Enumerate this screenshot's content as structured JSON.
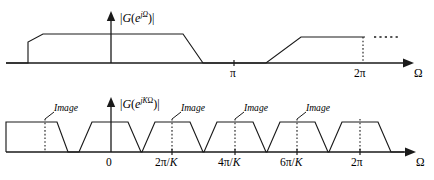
{
  "figure": {
    "title": "",
    "background": "#ffffff",
    "stroke_color": "#1a1a1a"
  },
  "top_plot": {
    "ylabel": {
      "mag_open": "|",
      "g": "G",
      "paren_open": "(",
      "e": "e",
      "exp": "jΩ",
      "paren_close": ")",
      "mag_close": "|"
    },
    "xlabel": "Ω",
    "ticks": [
      {
        "label": "π",
        "x_px": 234
      },
      {
        "label": "2π",
        "x_px": 363
      }
    ],
    "dotted_marker_label": "2π"
  },
  "bottom_plot": {
    "ylabel": {
      "mag_open": "|",
      "g": "G",
      "paren_open": "(",
      "e": "e",
      "exp_j": "j",
      "exp_k": "K",
      "exp_omega": "Ω",
      "paren_close": ")",
      "mag_close": "|"
    },
    "xlabel": "Ω",
    "ticks": [
      {
        "label": "0",
        "x_px": 110
      },
      {
        "label": "2π/K",
        "x_px": 172
      },
      {
        "label": "4π/K",
        "x_px": 235
      },
      {
        "label": "6π/K",
        "x_px": 297
      },
      {
        "label": "2π",
        "x_px": 360
      }
    ],
    "annotations": [
      {
        "label": "Image",
        "x_px": 52,
        "y_px": 108
      },
      {
        "label": "Image",
        "x_px": 190,
        "y_px": 108
      },
      {
        "label": "Image",
        "x_px": 252,
        "y_px": 108
      },
      {
        "label": "Image",
        "x_px": 315,
        "y_px": 108
      }
    ]
  },
  "chart_data": {
    "type": "line",
    "panels": [
      {
        "name": "top",
        "ylabel": "|G(e^{jΩ})|",
        "xlabel": "Ω",
        "xticks": [
          "π",
          "2π"
        ],
        "xtick_values": [
          3.14159,
          6.28319
        ],
        "description": "Lowpass magnitude response: flat passband around Ω=0, transition band down to zero before π, then mirrored rise after π back to flat, continuing periodically past 2π (shown dotted).",
        "series": [
          {
            "name": "|G(e^{jOmega})|",
            "points_px": [
              [
                6,
                63
              ],
              [
                28,
                63
              ],
              [
                28,
                42
              ],
              [
                42,
                34
              ],
              [
                183,
                34
              ],
              [
                203,
                63
              ],
              [
                266,
                63
              ],
              [
                301,
                37
              ],
              [
                363,
                37
              ]
            ],
            "continuation_dotted_px": [
              [
                375,
                37
              ],
              [
                400,
                37
              ]
            ]
          }
        ],
        "axis_px": {
          "x_start": 6,
          "x_end": 407,
          "y_baseline": 63,
          "y_axis_x": 111,
          "y_axis_top": 14
        }
      },
      {
        "name": "bottom",
        "ylabel": "|G(e^{jKΩ})|",
        "xlabel": "Ω",
        "xticks": [
          "0",
          "2π/K",
          "4π/K",
          "6π/K",
          "2π"
        ],
        "xtick_values": [
          0,
          1,
          2,
          3,
          6.28319
        ],
        "description": "After upsampling by K the spectrum is compressed and repeats every 2π/K, producing imaging replicas (labelled Image) at multiples of 2π/K.",
        "series": [
          {
            "name": "|G(e^{jKOmega})|",
            "trapezoids_px": [
              {
                "left_foot": null,
                "flat_left": 28,
                "flat_right": 57,
                "right_foot": 68,
                "clipped_left": true
              },
              {
                "left_foot": 79,
                "flat_left": 92,
                "flat_right": 128,
                "right_foot": 141
              },
              {
                "left_foot": 142,
                "flat_left": 155,
                "flat_right": 190,
                "right_foot": 203
              },
              {
                "left_foot": 204,
                "flat_left": 217,
                "flat_right": 253,
                "right_foot": 266
              },
              {
                "left_foot": 267,
                "flat_left": 280,
                "flat_right": 315,
                "right_foot": 328
              },
              {
                "left_foot": 329,
                "flat_left": 342,
                "flat_right": 378,
                "right_foot": 391
              }
            ],
            "top_y_px": 122,
            "baseline_y_px": 152
          }
        ],
        "axis_px": {
          "x_start": 6,
          "x_end": 410,
          "y_baseline": 152,
          "y_axis_x": 111,
          "y_axis_top": 100
        }
      }
    ]
  }
}
